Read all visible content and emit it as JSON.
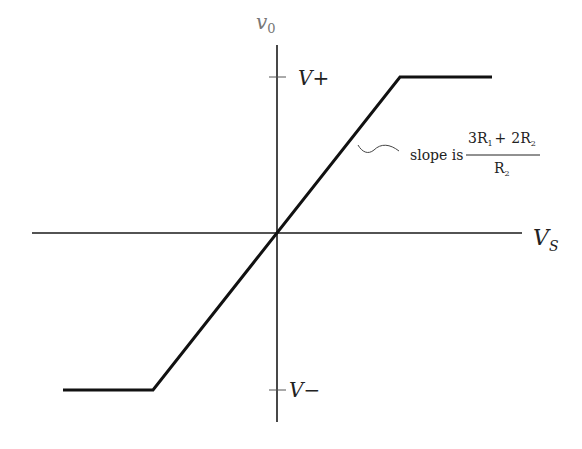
{
  "diagram": {
    "type": "transfer-characteristic",
    "axes": {
      "y_label_main": "v",
      "y_label_sub": "0",
      "x_label_main": "V",
      "x_label_sub": "S"
    },
    "ticks": {
      "upper": "V+",
      "lower": "V−"
    },
    "annotation": {
      "prefix": "slope is",
      "numerator": {
        "t1_coef": "3R",
        "t1_sub": "1",
        "plus": "+",
        "t2_coef": "2R",
        "t2_sub": "2"
      },
      "denominator": {
        "coef": "R",
        "sub": "2"
      }
    },
    "colors": {
      "curve": "#111111",
      "axis": "#1a1a1a",
      "label_light": "#777777"
    }
  }
}
